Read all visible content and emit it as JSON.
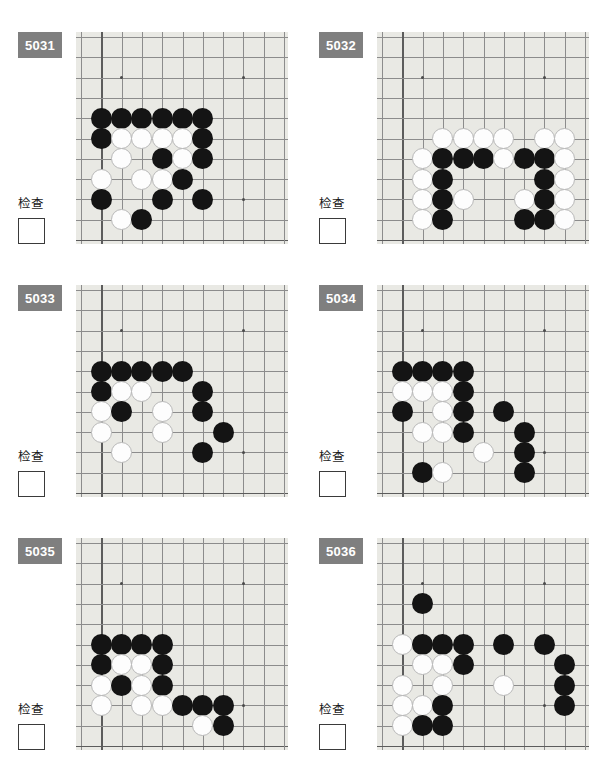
{
  "page": {
    "background_color": "#ffffff",
    "badge_color": "#7f7f7f",
    "board_color": "#e9e9e4",
    "grid_color": "#8c8c8c",
    "black_stone_color": "#141414",
    "white_stone_color": "#fdfdfd",
    "check_label": "检查",
    "columns": 2,
    "rows": 3
  },
  "board_geometry": {
    "grid_lines": 11,
    "cell_size": 20.3,
    "origin_x": 5,
    "origin_y": 5,
    "stone_diameter": 21,
    "star_points": [
      [
        2,
        2
      ],
      [
        8,
        2
      ],
      [
        8,
        8
      ]
    ],
    "edge_lines": {
      "left": 1,
      "bottom": 10
    }
  },
  "puzzles": [
    {
      "id": "5031",
      "label": "5031",
      "check_label": "检查",
      "checkbox_value": "",
      "position": {
        "col": 0,
        "row": 0
      },
      "stones": [
        {
          "color": "black",
          "x": 1,
          "y": 4
        },
        {
          "color": "black",
          "x": 2,
          "y": 4
        },
        {
          "color": "black",
          "x": 3,
          "y": 4
        },
        {
          "color": "black",
          "x": 4,
          "y": 4
        },
        {
          "color": "black",
          "x": 5,
          "y": 4
        },
        {
          "color": "black",
          "x": 6,
          "y": 4
        },
        {
          "color": "black",
          "x": 1,
          "y": 5
        },
        {
          "color": "white",
          "x": 2,
          "y": 5
        },
        {
          "color": "white",
          "x": 3,
          "y": 5
        },
        {
          "color": "white",
          "x": 4,
          "y": 5
        },
        {
          "color": "white",
          "x": 5,
          "y": 5
        },
        {
          "color": "black",
          "x": 6,
          "y": 5
        },
        {
          "color": "white",
          "x": 2,
          "y": 6
        },
        {
          "color": "black",
          "x": 4,
          "y": 6
        },
        {
          "color": "white",
          "x": 5,
          "y": 6
        },
        {
          "color": "black",
          "x": 6,
          "y": 6
        },
        {
          "color": "white",
          "x": 1,
          "y": 7
        },
        {
          "color": "white",
          "x": 3,
          "y": 7
        },
        {
          "color": "white",
          "x": 4,
          "y": 7
        },
        {
          "color": "black",
          "x": 5,
          "y": 7
        },
        {
          "color": "black",
          "x": 1,
          "y": 8
        },
        {
          "color": "black",
          "x": 4,
          "y": 8
        },
        {
          "color": "black",
          "x": 6,
          "y": 8
        },
        {
          "color": "white",
          "x": 2,
          "y": 9
        },
        {
          "color": "black",
          "x": 3,
          "y": 9
        }
      ]
    },
    {
      "id": "5032",
      "label": "5032",
      "check_label": "检查",
      "checkbox_value": "",
      "position": {
        "col": 1,
        "row": 0
      },
      "stones": [
        {
          "color": "white",
          "x": 3,
          "y": 5
        },
        {
          "color": "white",
          "x": 4,
          "y": 5
        },
        {
          "color": "white",
          "x": 5,
          "y": 5
        },
        {
          "color": "white",
          "x": 6,
          "y": 5
        },
        {
          "color": "white",
          "x": 8,
          "y": 5
        },
        {
          "color": "white",
          "x": 9,
          "y": 5
        },
        {
          "color": "white",
          "x": 2,
          "y": 6
        },
        {
          "color": "black",
          "x": 3,
          "y": 6
        },
        {
          "color": "black",
          "x": 4,
          "y": 6
        },
        {
          "color": "black",
          "x": 5,
          "y": 6
        },
        {
          "color": "white",
          "x": 6,
          "y": 6
        },
        {
          "color": "black",
          "x": 7,
          "y": 6
        },
        {
          "color": "black",
          "x": 8,
          "y": 6
        },
        {
          "color": "white",
          "x": 9,
          "y": 6
        },
        {
          "color": "white",
          "x": 2,
          "y": 7
        },
        {
          "color": "black",
          "x": 3,
          "y": 7
        },
        {
          "color": "black",
          "x": 8,
          "y": 7
        },
        {
          "color": "white",
          "x": 9,
          "y": 7
        },
        {
          "color": "white",
          "x": 2,
          "y": 8
        },
        {
          "color": "black",
          "x": 3,
          "y": 8
        },
        {
          "color": "white",
          "x": 4,
          "y": 8
        },
        {
          "color": "white",
          "x": 7,
          "y": 8
        },
        {
          "color": "black",
          "x": 8,
          "y": 8
        },
        {
          "color": "white",
          "x": 9,
          "y": 8
        },
        {
          "color": "white",
          "x": 2,
          "y": 9
        },
        {
          "color": "black",
          "x": 3,
          "y": 9
        },
        {
          "color": "black",
          "x": 7,
          "y": 9
        },
        {
          "color": "black",
          "x": 8,
          "y": 9
        },
        {
          "color": "white",
          "x": 9,
          "y": 9
        }
      ]
    },
    {
      "id": "5033",
      "label": "5033",
      "check_label": "检查",
      "checkbox_value": "",
      "position": {
        "col": 0,
        "row": 1
      },
      "stones": [
        {
          "color": "black",
          "x": 1,
          "y": 4
        },
        {
          "color": "black",
          "x": 2,
          "y": 4
        },
        {
          "color": "black",
          "x": 3,
          "y": 4
        },
        {
          "color": "black",
          "x": 4,
          "y": 4
        },
        {
          "color": "black",
          "x": 5,
          "y": 4
        },
        {
          "color": "black",
          "x": 1,
          "y": 5
        },
        {
          "color": "white",
          "x": 2,
          "y": 5
        },
        {
          "color": "white",
          "x": 3,
          "y": 5
        },
        {
          "color": "black",
          "x": 6,
          "y": 5
        },
        {
          "color": "white",
          "x": 1,
          "y": 6
        },
        {
          "color": "black",
          "x": 2,
          "y": 6
        },
        {
          "color": "white",
          "x": 4,
          "y": 6
        },
        {
          "color": "black",
          "x": 6,
          "y": 6
        },
        {
          "color": "white",
          "x": 1,
          "y": 7
        },
        {
          "color": "white",
          "x": 4,
          "y": 7
        },
        {
          "color": "black",
          "x": 7,
          "y": 7
        },
        {
          "color": "white",
          "x": 2,
          "y": 8
        },
        {
          "color": "black",
          "x": 6,
          "y": 8
        }
      ]
    },
    {
      "id": "5034",
      "label": "5034",
      "check_label": "检查",
      "checkbox_value": "",
      "position": {
        "col": 1,
        "row": 1
      },
      "stones": [
        {
          "color": "black",
          "x": 1,
          "y": 4
        },
        {
          "color": "black",
          "x": 2,
          "y": 4
        },
        {
          "color": "black",
          "x": 3,
          "y": 4
        },
        {
          "color": "black",
          "x": 4,
          "y": 4
        },
        {
          "color": "white",
          "x": 1,
          "y": 5
        },
        {
          "color": "white",
          "x": 2,
          "y": 5
        },
        {
          "color": "white",
          "x": 3,
          "y": 5
        },
        {
          "color": "black",
          "x": 4,
          "y": 5
        },
        {
          "color": "black",
          "x": 1,
          "y": 6
        },
        {
          "color": "white",
          "x": 3,
          "y": 6
        },
        {
          "color": "black",
          "x": 4,
          "y": 6
        },
        {
          "color": "black",
          "x": 6,
          "y": 6
        },
        {
          "color": "white",
          "x": 2,
          "y": 7
        },
        {
          "color": "white",
          "x": 3,
          "y": 7
        },
        {
          "color": "black",
          "x": 4,
          "y": 7
        },
        {
          "color": "black",
          "x": 7,
          "y": 7
        },
        {
          "color": "white",
          "x": 5,
          "y": 8
        },
        {
          "color": "black",
          "x": 7,
          "y": 8
        },
        {
          "color": "black",
          "x": 2,
          "y": 9
        },
        {
          "color": "white",
          "x": 3,
          "y": 9
        },
        {
          "color": "black",
          "x": 7,
          "y": 9
        }
      ]
    },
    {
      "id": "5035",
      "label": "5035",
      "check_label": "检查",
      "checkbox_value": "",
      "position": {
        "col": 0,
        "row": 2
      },
      "stones": [
        {
          "color": "black",
          "x": 1,
          "y": 5
        },
        {
          "color": "black",
          "x": 2,
          "y": 5
        },
        {
          "color": "black",
          "x": 3,
          "y": 5
        },
        {
          "color": "black",
          "x": 4,
          "y": 5
        },
        {
          "color": "black",
          "x": 1,
          "y": 6
        },
        {
          "color": "white",
          "x": 2,
          "y": 6
        },
        {
          "color": "white",
          "x": 3,
          "y": 6
        },
        {
          "color": "black",
          "x": 4,
          "y": 6
        },
        {
          "color": "white",
          "x": 1,
          "y": 7
        },
        {
          "color": "black",
          "x": 2,
          "y": 7
        },
        {
          "color": "white",
          "x": 3,
          "y": 7
        },
        {
          "color": "black",
          "x": 4,
          "y": 7
        },
        {
          "color": "white",
          "x": 1,
          "y": 8
        },
        {
          "color": "white",
          "x": 3,
          "y": 8
        },
        {
          "color": "white",
          "x": 4,
          "y": 8
        },
        {
          "color": "black",
          "x": 5,
          "y": 8
        },
        {
          "color": "black",
          "x": 6,
          "y": 8
        },
        {
          "color": "black",
          "x": 7,
          "y": 8
        },
        {
          "color": "white",
          "x": 6,
          "y": 9
        },
        {
          "color": "black",
          "x": 7,
          "y": 9
        }
      ]
    },
    {
      "id": "5036",
      "label": "5036",
      "check_label": "检查",
      "checkbox_value": "",
      "position": {
        "col": 1,
        "row": 2
      },
      "stones": [
        {
          "color": "black",
          "x": 2,
          "y": 3
        },
        {
          "color": "white",
          "x": 1,
          "y": 5
        },
        {
          "color": "black",
          "x": 2,
          "y": 5
        },
        {
          "color": "black",
          "x": 3,
          "y": 5
        },
        {
          "color": "black",
          "x": 4,
          "y": 5
        },
        {
          "color": "black",
          "x": 6,
          "y": 5
        },
        {
          "color": "black",
          "x": 8,
          "y": 5
        },
        {
          "color": "white",
          "x": 2,
          "y": 6
        },
        {
          "color": "white",
          "x": 3,
          "y": 6
        },
        {
          "color": "black",
          "x": 4,
          "y": 6
        },
        {
          "color": "black",
          "x": 9,
          "y": 6
        },
        {
          "color": "white",
          "x": 1,
          "y": 7
        },
        {
          "color": "white",
          "x": 3,
          "y": 7
        },
        {
          "color": "white",
          "x": 6,
          "y": 7
        },
        {
          "color": "black",
          "x": 9,
          "y": 7
        },
        {
          "color": "white",
          "x": 1,
          "y": 8
        },
        {
          "color": "white",
          "x": 2,
          "y": 8
        },
        {
          "color": "black",
          "x": 3,
          "y": 8
        },
        {
          "color": "black",
          "x": 9,
          "y": 8
        },
        {
          "color": "white",
          "x": 1,
          "y": 9
        },
        {
          "color": "black",
          "x": 2,
          "y": 9
        },
        {
          "color": "black",
          "x": 3,
          "y": 9
        }
      ]
    }
  ]
}
